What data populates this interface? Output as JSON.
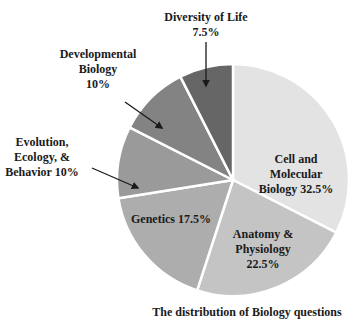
{
  "chart_data": {
    "type": "pie",
    "title": "The distribution of Biology questions",
    "start_angle_deg": 0,
    "direction": "clockwise",
    "slices": [
      {
        "label": "Cell and Molecular Biology",
        "value": 32.5,
        "display": "Cell and|Molecular|Biology 32.5%",
        "color": "#e3e3e3"
      },
      {
        "label": "Anatomy & Physiology",
        "value": 22.5,
        "display": "Anatomy &|Physiology|22.5%",
        "color": "#c4c4c4"
      },
      {
        "label": "Genetics",
        "value": 17.5,
        "display": "Genetics 17.5%",
        "color": "#adadad"
      },
      {
        "label": "Evolution, Ecology, & Behavior",
        "value": 10,
        "display": "Evolution,|Ecology, &|Behavior 10%",
        "color": "#9a9a9a"
      },
      {
        "label": "Developmental Biology",
        "value": 10,
        "display": "Developmental|Biology|10%",
        "color": "#838383"
      },
      {
        "label": "Diversity of Life",
        "value": 7.5,
        "display": "Diversity of Life|7.5%",
        "color": "#666666"
      }
    ],
    "legend": "none",
    "grid": false
  },
  "layout": {
    "cx": 233,
    "cy": 180,
    "r": 116,
    "labels": [
      {
        "x": 296,
        "y": 163,
        "inside": true
      },
      {
        "x": 263,
        "y": 238,
        "inside": true
      },
      {
        "x": 171,
        "y": 223,
        "inside": true
      },
      {
        "x": 42,
        "y": 146,
        "inside": false,
        "arrow": [
          [
            92,
            168
          ],
          [
            138,
            188
          ]
        ]
      },
      {
        "x": 98,
        "y": 58,
        "inside": false,
        "arrow": [
          [
            125,
            102
          ],
          [
            162,
            128
          ]
        ]
      },
      {
        "x": 206,
        "y": 21,
        "inside": false,
        "arrow": [
          [
            206,
            42
          ],
          [
            206,
            86
          ]
        ]
      }
    ],
    "title_pos": {
      "x": 247,
      "y": 316
    }
  }
}
